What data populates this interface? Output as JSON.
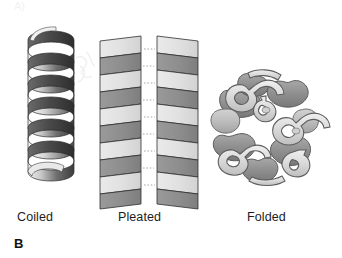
{
  "figure": {
    "panel_letter": "B",
    "top_partial_label": "A)",
    "background_color": "#ffffff",
    "text_color": "#1c1c1c"
  },
  "structures": [
    {
      "id": "coiled",
      "label": "Coiled",
      "icon_name": "alpha-helix-ribbon-icon",
      "turns": 5,
      "colors": {
        "ribbon_dark": "#3a3a3a",
        "ribbon_mid": "#7d7d7d",
        "ribbon_light": "#e8e8e8",
        "outline": "#2b2b2b"
      }
    },
    {
      "id": "pleated",
      "label": "Pleated",
      "icon_name": "beta-pleated-sheet-icon",
      "strands": 2,
      "facets_per_strand": 10,
      "hydrogen_bond_style": "dotted",
      "colors": {
        "facet_light": "#e2e2e2",
        "facet_dark": "#8e8e8e",
        "outline": "#2e2e2e",
        "bond_line": "#9a9a9a"
      }
    },
    {
      "id": "folded",
      "label": "Folded",
      "icon_name": "globular-folded-protein-icon",
      "colors": {
        "tube_light": "#dcdcdc",
        "tube_mid": "#b4b4b4",
        "tube_dark": "#8d8d8d",
        "outline": "#4a4a4a"
      }
    }
  ]
}
